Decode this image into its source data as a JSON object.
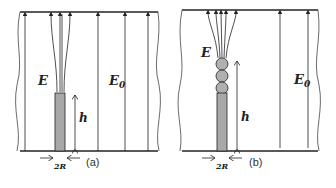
{
  "panels": [
    {
      "id": "a",
      "caption": "(a)",
      "field_label_local": "E",
      "field_label_far": "E",
      "field_label_far_sub": "0",
      "height_label": "h",
      "width_label": "2R",
      "tip": "bare-cylinder"
    },
    {
      "id": "b",
      "caption": "(b)",
      "field_label_local": "E",
      "field_label_far": "E",
      "field_label_far_sub": "0",
      "height_label": "h",
      "width_label": "2R",
      "tip": "cylinder-with-three-spheres"
    }
  ],
  "colors": {
    "line": "#222222",
    "rod_fill": "#a8a8a8",
    "sphere_fill": "#b0b0b0"
  }
}
